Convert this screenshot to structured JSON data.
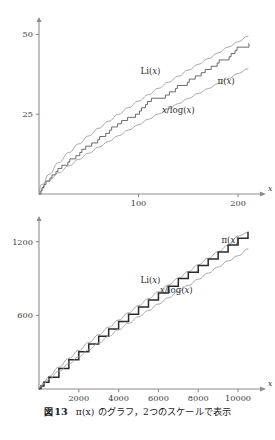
{
  "caption": {
    "label": "図",
    "number": "13",
    "text": "π(x) のグラフ，2つのスケールで表示",
    "full": "図 13  π(x) のグラフ，2つのスケールで表示"
  },
  "colors": {
    "axis": "#8d8d8d",
    "smooth_curve": "#9a9a9a",
    "step_curve": "#5a5a5a",
    "thick_curve": "#2a2a2a",
    "text": "#1a1a1a",
    "background": "#ffffff"
  },
  "chart_data": [
    {
      "id": "top",
      "type": "line",
      "title": "",
      "xlabel": "x",
      "ylabel": "",
      "xlim": [
        0,
        210
      ],
      "ylim": [
        0,
        52
      ],
      "xticks": [
        100,
        200
      ],
      "xtick_labels": [
        "100",
        "200"
      ],
      "yticks": [
        25,
        50
      ],
      "ytick_labels": [
        "25",
        "50"
      ],
      "grid": false,
      "legend": "inline-annotations",
      "annotations": [
        {
          "text": "Li(x)",
          "x": 112,
          "y": 37.5
        },
        {
          "text": "π(x)",
          "x": 188,
          "y": 34.5
        },
        {
          "text": "x/log(x)",
          "x": 140,
          "y": 25.5
        }
      ],
      "series": [
        {
          "name": "Li(x)",
          "kind": "smooth",
          "style": "light",
          "x": [
            2,
            10,
            20,
            30,
            40,
            50,
            60,
            70,
            80,
            90,
            100,
            110,
            120,
            130,
            140,
            150,
            160,
            170,
            180,
            190,
            200,
            210
          ],
          "values": [
            1.04,
            6.17,
            9.9,
            13.0,
            15.7,
            18.2,
            20.6,
            22.8,
            25.0,
            27.1,
            29.1,
            31.1,
            33.1,
            35.0,
            36.9,
            38.8,
            40.6,
            42.4,
            44.2,
            46.0,
            47.7,
            49.5
          ]
        },
        {
          "name": "π(x)",
          "kind": "step",
          "style": "dark",
          "x": [
            2,
            3,
            5,
            7,
            11,
            13,
            17,
            19,
            23,
            29,
            31,
            37,
            41,
            43,
            47,
            53,
            59,
            61,
            67,
            71,
            73,
            79,
            83,
            89,
            97,
            101,
            103,
            107,
            109,
            113,
            127,
            131,
            137,
            139,
            149,
            151,
            157,
            163,
            167,
            173,
            179,
            181,
            191,
            193,
            197,
            199,
            211
          ],
          "values": [
            1,
            2,
            3,
            4,
            5,
            6,
            7,
            8,
            9,
            10,
            11,
            12,
            13,
            14,
            15,
            16,
            17,
            18,
            19,
            20,
            21,
            22,
            23,
            24,
            25,
            26,
            27,
            28,
            29,
            30,
            31,
            32,
            33,
            34,
            35,
            36,
            37,
            38,
            39,
            40,
            41,
            42,
            43,
            44,
            45,
            46,
            47
          ]
        },
        {
          "name": "x/log(x)",
          "kind": "smooth",
          "style": "light",
          "x": [
            2,
            10,
            20,
            30,
            40,
            50,
            60,
            70,
            80,
            90,
            100,
            110,
            120,
            130,
            140,
            150,
            160,
            170,
            180,
            190,
            200,
            210
          ],
          "values": [
            2.89,
            4.34,
            6.68,
            8.82,
            10.84,
            12.78,
            14.66,
            16.49,
            18.27,
            20.03,
            21.71,
            23.42,
            25.06,
            26.69,
            28.3,
            29.93,
            31.49,
            33.02,
            34.57,
            36.11,
            37.73,
            39.28
          ]
        }
      ]
    },
    {
      "id": "bottom",
      "type": "line",
      "title": "",
      "xlabel": "x",
      "ylabel": "",
      "xlim": [
        0,
        10500
      ],
      "ylim": [
        0,
        1320
      ],
      "xticks": [
        2000,
        4000,
        6000,
        8000,
        10000
      ],
      "xtick_labels": [
        "2000",
        "4000",
        "6000",
        "8000",
        "10000"
      ],
      "yticks": [
        600,
        1200
      ],
      "ytick_labels": [
        "600",
        "1200"
      ],
      "grid": false,
      "legend": "inline-annotations",
      "annotations": [
        {
          "text": "Li(x)",
          "x": 5600,
          "y": 860
        },
        {
          "text": "π(x)",
          "x": 9600,
          "y": 1190
        },
        {
          "text": "x/log(x)",
          "x": 6900,
          "y": 780
        }
      ],
      "series": [
        {
          "name": "Li(x)",
          "kind": "smooth",
          "style": "light",
          "x": [
            10,
            100,
            250,
            500,
            1000,
            1500,
            2000,
            2500,
            3000,
            3500,
            4000,
            4500,
            5000,
            5500,
            6000,
            6500,
            7000,
            7500,
            8000,
            8500,
            9000,
            9500,
            10000,
            10500
          ],
          "values": [
            6,
            30,
            60,
            102,
            178,
            249,
            315,
            379,
            442,
            503,
            562,
            621,
            679,
            736,
            792,
            848,
            903,
            957,
            1012,
            1065,
            1118,
            1171,
            1246,
            1276
          ]
        },
        {
          "name": "π(x)",
          "kind": "step-thick",
          "style": "dark",
          "x": [
            10,
            100,
            250,
            500,
            1000,
            1500,
            2000,
            2500,
            3000,
            3500,
            4000,
            4500,
            5000,
            5500,
            6000,
            6500,
            7000,
            7500,
            8000,
            8500,
            9000,
            9500,
            10000,
            10500
          ],
          "values": [
            4,
            25,
            54,
            95,
            168,
            239,
            303,
            367,
            430,
            489,
            550,
            610,
            669,
            726,
            783,
            838,
            900,
            951,
            1007,
            1060,
            1117,
            1173,
            1229,
            1281
          ]
        },
        {
          "name": "x/log(x)",
          "kind": "smooth",
          "style": "light",
          "x": [
            10,
            100,
            250,
            500,
            1000,
            1500,
            2000,
            2500,
            3000,
            3500,
            4000,
            4500,
            5000,
            5500,
            6000,
            6500,
            7000,
            7500,
            8000,
            8500,
            9000,
            9500,
            10000,
            10500
          ],
          "values": [
            4.3,
            21.7,
            45.3,
            80.5,
            144.8,
            205.1,
            263.1,
            319.6,
            374.9,
            429.3,
            482.9,
            535.9,
            588.4,
            640.3,
            691.9,
            743.0,
            793.8,
            844.3,
            894.5,
            944.4,
            994.1,
            1043.5,
            1085.7,
            1142.0
          ]
        }
      ]
    }
  ]
}
